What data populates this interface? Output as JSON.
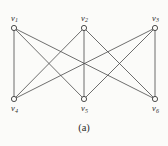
{
  "figure": {
    "caption": "(a)",
    "background_color": "#fbfbf9",
    "edge_color": "#4a4a4a",
    "vertex_stroke_color": "#3a3a3a",
    "vertex_fill_color": "#fbfbf9",
    "label_color": "#2b2b2b"
  },
  "chart_data": {
    "type": "diagram",
    "graph_type": "complete bipartite graph K3,3",
    "title": "(a)",
    "vertices": [
      {
        "id": "v1",
        "label": "v",
        "subscript": "1",
        "x": 14,
        "y": 28,
        "part": "top",
        "label_position": "above"
      },
      {
        "id": "v2",
        "label": "v",
        "subscript": "2",
        "x": 84,
        "y": 28,
        "part": "top",
        "label_position": "above"
      },
      {
        "id": "v3",
        "label": "v",
        "subscript": "3",
        "x": 155,
        "y": 28,
        "part": "top",
        "label_position": "above"
      },
      {
        "id": "v4",
        "label": "v",
        "subscript": "4",
        "x": 14,
        "y": 99,
        "part": "bottom",
        "label_position": "below"
      },
      {
        "id": "v5",
        "label": "v",
        "subscript": "5",
        "x": 84,
        "y": 99,
        "part": "bottom",
        "label_position": "below"
      },
      {
        "id": "v6",
        "label": "v",
        "subscript": "6",
        "x": 155,
        "y": 99,
        "part": "bottom",
        "label_position": "below"
      }
    ],
    "edges": [
      {
        "from": "v1",
        "to": "v4"
      },
      {
        "from": "v1",
        "to": "v5"
      },
      {
        "from": "v1",
        "to": "v6"
      },
      {
        "from": "v2",
        "to": "v4"
      },
      {
        "from": "v2",
        "to": "v5"
      },
      {
        "from": "v2",
        "to": "v6"
      },
      {
        "from": "v3",
        "to": "v4"
      },
      {
        "from": "v3",
        "to": "v5"
      },
      {
        "from": "v3",
        "to": "v6"
      }
    ],
    "edge_count": 9,
    "vertex_count": 6,
    "vertex_radius": 2.6
  }
}
